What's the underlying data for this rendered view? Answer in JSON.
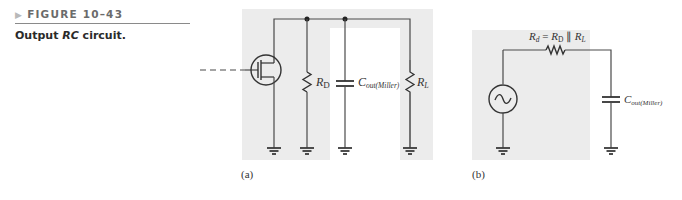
{
  "figure": {
    "number": "FIGURE 10–43",
    "caption_prefix": "Output ",
    "caption_italic": "RC",
    "caption_suffix": " circuit."
  },
  "circuit_a": {
    "panel_label": "(a)",
    "components": {
      "drain_resistor": {
        "symbol": "R",
        "subscript": "D"
      },
      "capacitor": {
        "symbol": "C",
        "subscript": "out(Miller)"
      },
      "load_resistor": {
        "symbol": "R",
        "subscript": "L"
      }
    },
    "transistor": "mosfet-icon"
  },
  "circuit_b": {
    "panel_label": "(b)",
    "resistor_label": {
      "symbol": "R",
      "subscript": "d",
      "equals": " = ",
      "rd_symbol": "R",
      "rd_subscript": "D",
      "parallel": " ∥ ",
      "rl_symbol": "R",
      "rl_subscript": "L"
    },
    "capacitor": {
      "symbol": "C",
      "subscript": "out(Miller)"
    },
    "source": "ac-source-icon"
  },
  "colors": {
    "panel_bg": "#ececec",
    "wire": "#4a4a4a"
  }
}
